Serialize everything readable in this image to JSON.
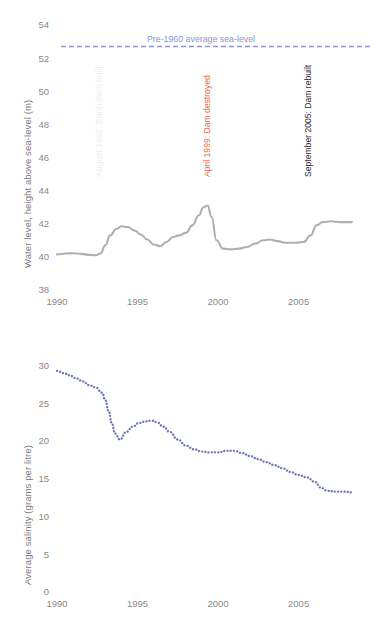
{
  "chart_data": [
    {
      "id": "water-level",
      "type": "line",
      "title": "",
      "xlabel": "",
      "ylabel": "Water level, height above sea-level (m)",
      "xlim": [
        1990,
        2008.5
      ],
      "ylim": [
        38,
        54
      ],
      "yticks": [
        54,
        52,
        50,
        48,
        46,
        44,
        42,
        40,
        38
      ],
      "xticks": [
        1990,
        1995,
        2000,
        2005
      ],
      "grid": false,
      "legend_position": "none",
      "series": [
        {
          "name": "Water level",
          "color": "#b0b0b0",
          "style": "solid",
          "x": [
            1990.0,
            1990.5,
            1991.0,
            1991.5,
            1992.0,
            1992.4,
            1992.7,
            1993.0,
            1993.3,
            1993.7,
            1994.0,
            1994.4,
            1994.8,
            1995.2,
            1995.6,
            1996.0,
            1996.4,
            1996.8,
            1997.2,
            1997.6,
            1998.0,
            1998.4,
            1998.8,
            1999.1,
            1999.35,
            1999.6,
            1999.9,
            2000.3,
            2000.8,
            2001.3,
            2001.8,
            2002.3,
            2002.8,
            2003.2,
            2003.7,
            2004.2,
            2004.8,
            2005.3,
            2005.75,
            2006.1,
            2006.5,
            2007.0,
            2007.6,
            2008.3
          ],
          "y": [
            40.15,
            40.2,
            40.22,
            40.18,
            40.12,
            40.1,
            40.2,
            40.7,
            41.3,
            41.7,
            41.85,
            41.8,
            41.6,
            41.35,
            41.05,
            40.75,
            40.65,
            40.9,
            41.2,
            41.3,
            41.45,
            41.9,
            42.5,
            43.0,
            43.1,
            42.4,
            41.0,
            40.5,
            40.45,
            40.5,
            40.6,
            40.8,
            41.0,
            41.05,
            40.95,
            40.85,
            40.85,
            40.9,
            41.3,
            41.9,
            42.1,
            42.15,
            42.1,
            42.1
          ]
        }
      ],
      "reference_line": {
        "label": "Pre-1960 average sea-level",
        "value": 52.7,
        "color": "#8d93d4",
        "style": "dashed"
      },
      "annotations": [
        {
          "label": "August 1992: Earth dam built",
          "x": 1992.6,
          "color": "#eeeeee"
        },
        {
          "label": "April 1999: Dam destroyed",
          "x": 1999.3,
          "color": "#e8674a"
        },
        {
          "label": "September 2005: Dam rebuilt",
          "x": 2005.6,
          "color": "#2b2b2b"
        }
      ]
    },
    {
      "id": "average-salinity",
      "type": "line",
      "title": "",
      "xlabel": "",
      "ylabel": "Average salinity (grams per litre)",
      "xlim": [
        1990,
        2008.5
      ],
      "ylim": [
        0,
        31
      ],
      "yticks": [
        30,
        25,
        20,
        15,
        10,
        5,
        0
      ],
      "xticks": [
        1990,
        1995,
        2000,
        2005
      ],
      "grid": false,
      "legend_position": "none",
      "series": [
        {
          "name": "Average salinity",
          "color": "#6d74b8",
          "style": "dotted",
          "x": [
            1990.0,
            1990.4,
            1990.8,
            1991.2,
            1991.6,
            1992.0,
            1992.4,
            1992.8,
            1993.0,
            1993.2,
            1993.4,
            1993.6,
            1993.9,
            1994.3,
            1994.7,
            1995.1,
            1995.5,
            1995.9,
            1996.2,
            1996.6,
            1997.0,
            1997.5,
            1998.0,
            1998.5,
            1999.0,
            1999.5,
            2000.0,
            2000.5,
            2001.0,
            2001.5,
            2002.0,
            2002.5,
            2003.0,
            2003.5,
            2004.0,
            2004.5,
            2005.0,
            2005.5,
            2006.0,
            2006.4,
            2006.8,
            2007.3,
            2007.8,
            2008.3
          ],
          "y": [
            29.3,
            29.0,
            28.7,
            28.3,
            27.9,
            27.4,
            27.1,
            26.4,
            25.4,
            24.0,
            22.4,
            21.0,
            20.2,
            21.2,
            21.9,
            22.4,
            22.6,
            22.7,
            22.5,
            21.9,
            21.2,
            20.2,
            19.4,
            18.9,
            18.6,
            18.5,
            18.5,
            18.7,
            18.7,
            18.4,
            18.0,
            17.6,
            17.2,
            16.8,
            16.4,
            15.9,
            15.5,
            15.2,
            14.6,
            13.8,
            13.4,
            13.3,
            13.3,
            13.2
          ]
        }
      ]
    }
  ],
  "caption": {
    "cut_off_line": ""
  }
}
